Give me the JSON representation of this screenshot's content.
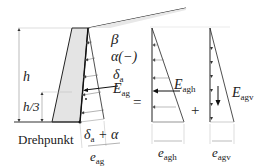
{
  "diagram": {
    "labels": {
      "beta": "β",
      "alpha": "α(−)",
      "delta_a_sym": "δ",
      "delta_a_sub": "a",
      "E_ag_sym": "E",
      "E_ag_sub": "ag",
      "h": "h",
      "h3": "h/3",
      "pivot": "Drehpunkt",
      "delta_alpha_sym": "δ",
      "delta_alpha_sub": "a",
      "delta_alpha_rest": " + α",
      "e_ag_sym": "e",
      "e_ag_sub": "ag",
      "equals": "=",
      "plus": "+",
      "E_agh_sym": "E",
      "E_agh_sub": "agh",
      "E_agv_sym": "E",
      "E_agv_sub": "agv",
      "e_agh_sym": "e",
      "e_agh_sub": "agh",
      "e_agv_sym": "e",
      "e_agv_sub": "agv"
    },
    "colors": {
      "line": "#222222",
      "wall_fill": "#e4e4e4",
      "thin": "#888888"
    }
  }
}
